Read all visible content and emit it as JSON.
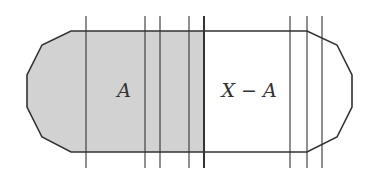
{
  "diagram": {
    "type": "set-partition-diagram",
    "labels": {
      "left_region": "A",
      "right_region": "X − A"
    },
    "colors": {
      "shaded_fill": "#d2d2d2",
      "unshaded_fill": "#ffffff",
      "stroke": "#333333",
      "background": "#ffffff"
    },
    "geometry": {
      "top_y": 31,
      "bottom_y": 152,
      "split_x": 204,
      "vertical_line_top_y": 16,
      "vertical_line_bottom_y": 168,
      "vertical_lines_x": [
        86,
        145,
        160,
        189,
        204,
        290,
        307,
        322
      ],
      "emphasized_line_x": 204
    }
  }
}
